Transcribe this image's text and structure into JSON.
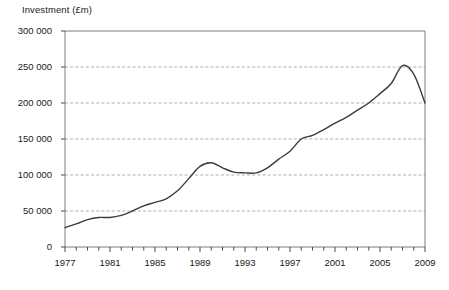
{
  "chart_data": {
    "type": "line",
    "title": "Investment (£m)",
    "xlabel": "",
    "ylabel": "Investment (£m)",
    "xlim": [
      1977,
      2009
    ],
    "ylim": [
      0,
      300000
    ],
    "grid": true,
    "legend": "none",
    "y_ticks": [
      0,
      50000,
      100000,
      150000,
      200000,
      250000,
      300000
    ],
    "y_tick_labels": [
      "0",
      "50 000",
      "100 000",
      "150 000",
      "200 000",
      "250 000",
      "300 000"
    ],
    "x_ticks": [
      1977,
      1978,
      1979,
      1980,
      1981,
      1982,
      1983,
      1984,
      1985,
      1986,
      1987,
      1988,
      1989,
      1990,
      1991,
      1992,
      1993,
      1994,
      1995,
      1996,
      1997,
      1998,
      1999,
      2000,
      2001,
      2002,
      2003,
      2004,
      2005,
      2006,
      2007,
      2008,
      2009
    ],
    "x_tick_labels": [
      "1977",
      "1981",
      "1985",
      "1989",
      "1993",
      "1997",
      "2001",
      "2005",
      "2009"
    ],
    "x_labelled_ticks": [
      1977,
      1981,
      1985,
      1989,
      1993,
      1997,
      2001,
      2005,
      2009
    ],
    "series": [
      {
        "name": "Investment (£m)",
        "color": "#3c3c3c",
        "x": [
          1977,
          1978,
          1979,
          1980,
          1981,
          1982,
          1983,
          1984,
          1985,
          1986,
          1987,
          1988,
          1989,
          1990,
          1991,
          1992,
          1993,
          1994,
          1995,
          1996,
          1997,
          1998,
          1999,
          2000,
          2001,
          2002,
          2003,
          2004,
          2005,
          2006,
          2007,
          2008,
          2009
        ],
        "values": [
          27000,
          32000,
          38000,
          41000,
          41000,
          44000,
          50000,
          57000,
          62000,
          67000,
          78000,
          95000,
          112000,
          117000,
          110000,
          104000,
          103000,
          103000,
          110000,
          122000,
          133000,
          150000,
          155000,
          163000,
          172000,
          180000,
          190000,
          200000,
          213000,
          227000,
          252000,
          240000,
          200000
        ]
      }
    ]
  }
}
